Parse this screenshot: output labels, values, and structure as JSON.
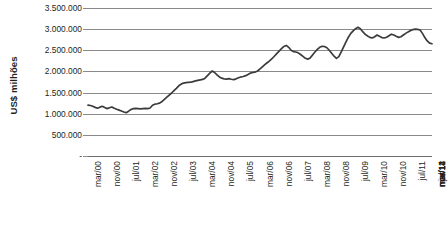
{
  "chart_data": {
    "type": "line",
    "title": "",
    "subtitle": "",
    "xlabel": "",
    "ylabel": "US$ milhões",
    "ylim": [
      0,
      3500000
    ],
    "grid": true,
    "legend": false,
    "legend_position": "none",
    "y_ticks": [
      {
        "value": 3500000,
        "label": "3.500.000"
      },
      {
        "value": 3000000,
        "label": "3.000.000"
      },
      {
        "value": 2500000,
        "label": "2.500.000"
      },
      {
        "value": 2000000,
        "label": "2.000.000"
      },
      {
        "value": 1500000,
        "label": "1.500.000"
      },
      {
        "value": 1000000,
        "label": "1.000.000"
      },
      {
        "value": 500000,
        "label": "500.000"
      },
      {
        "value": 0,
        "label": "-"
      }
    ],
    "x_tick_labels": [
      "mar/00",
      "nov/00",
      "jul/01",
      "mar/02",
      "nov/02",
      "jul/03",
      "mar/04",
      "nov/04",
      "jul/05",
      "mar/06",
      "nov/06",
      "jul/07",
      "mar/08",
      "nov/08",
      "jul/09",
      "mar/10",
      "nov/10",
      "jul/11",
      "mar/12",
      "nov/12",
      "jul/13",
      "mar/14",
      "nov/14"
    ],
    "x_tick_interval_months": 8,
    "x_start": "mar/00",
    "x_end": "nov/14",
    "series": [
      {
        "name": "US$ milhões",
        "color": "#3b3b3b",
        "values": [
          1205000,
          1195000,
          1175000,
          1150000,
          1130000,
          1155000,
          1175000,
          1145000,
          1120000,
          1140000,
          1160000,
          1130000,
          1105000,
          1085000,
          1065000,
          1040000,
          1025000,
          1060000,
          1100000,
          1120000,
          1125000,
          1120000,
          1115000,
          1120000,
          1125000,
          1120000,
          1135000,
          1200000,
          1225000,
          1235000,
          1250000,
          1290000,
          1340000,
          1390000,
          1440000,
          1490000,
          1545000,
          1600000,
          1660000,
          1700000,
          1725000,
          1735000,
          1740000,
          1745000,
          1760000,
          1775000,
          1790000,
          1800000,
          1810000,
          1840000,
          1900000,
          1960000,
          2010000,
          1975000,
          1920000,
          1870000,
          1840000,
          1825000,
          1820000,
          1830000,
          1815000,
          1805000,
          1825000,
          1850000,
          1870000,
          1880000,
          1900000,
          1930000,
          1960000,
          1975000,
          1985000,
          2010000,
          2060000,
          2110000,
          2160000,
          2205000,
          2250000,
          2300000,
          2360000,
          2420000,
          2480000,
          2540000,
          2590000,
          2615000,
          2570000,
          2500000,
          2470000,
          2460000,
          2440000,
          2400000,
          2355000,
          2310000,
          2290000,
          2320000,
          2390000,
          2460000,
          2520000,
          2570000,
          2595000,
          2590000,
          2560000,
          2500000,
          2430000,
          2360000,
          2310000,
          2350000,
          2460000,
          2580000,
          2700000,
          2810000,
          2900000,
          2960000,
          3010000,
          3045000,
          3010000,
          2940000,
          2880000,
          2840000,
          2805000,
          2790000,
          2820000,
          2860000,
          2830000,
          2800000,
          2790000,
          2810000,
          2845000,
          2880000,
          2860000,
          2830000,
          2805000,
          2820000,
          2860000,
          2900000,
          2935000,
          2965000,
          2990000,
          3000000,
          2995000,
          2980000,
          2900000,
          2800000,
          2720000,
          2670000,
          2655000
        ]
      }
    ]
  }
}
